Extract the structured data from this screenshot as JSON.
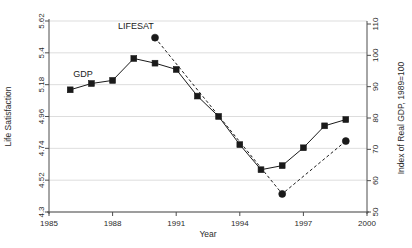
{
  "chart_data": {
    "type": "line",
    "title": "",
    "xlabel": "Year",
    "ylabel_left": "Life Satisfaction",
    "ylabel_right": "Index of Real GDP, 1989=100",
    "xlim": [
      1985,
      2000
    ],
    "ylim_left": [
      4.3,
      5.62
    ],
    "ylim_right": [
      50,
      110
    ],
    "xticks": [
      1985,
      1988,
      1991,
      1994,
      1997,
      2000
    ],
    "xtick_labels": [
      "1985",
      "1988",
      "1991",
      "1994",
      "1997",
      "2000"
    ],
    "yticks_left": [
      4.3,
      4.52,
      4.74,
      4.96,
      5.18,
      5.4,
      5.62
    ],
    "ytick_labels_left": [
      "4.3",
      "4.52",
      "4.74",
      "4.96",
      "5.18",
      "5.4",
      "5.62"
    ],
    "yticks_right": [
      50,
      60,
      70,
      80,
      90,
      100,
      110
    ],
    "ytick_labels_right": [
      "50",
      "60",
      "70",
      "80",
      "90",
      "100",
      "110"
    ],
    "grid": true,
    "grid_axis": "y",
    "legend": "inline-annotations",
    "series": [
      {
        "name": "GDP",
        "axis": "right",
        "marker": "square",
        "linestyle": "solid",
        "color": "#1a1a1a",
        "label_x": 1986.6,
        "label_y": 92.5,
        "x": [
          1986,
          1987,
          1988,
          1989,
          1990,
          1991,
          1992,
          1993,
          1994,
          1995,
          1996,
          1997,
          1998,
          1999
        ],
        "values": [
          89.0,
          91.0,
          92.0,
          99.0,
          97.5,
          95.5,
          87.0,
          80.5,
          71.5,
          63.5,
          64.8,
          70.5,
          77.5,
          79.5
        ]
      },
      {
        "name": "LIFESAT",
        "axis": "left",
        "marker": "circle",
        "linestyle": "dashed",
        "color": "#1a1a1a",
        "label_x": 1989.1,
        "label_y": 5.565,
        "x": [
          1990,
          1996,
          1999
        ],
        "values": [
          5.505,
          4.425,
          4.79
        ]
      }
    ],
    "annotations": [
      {
        "text": "LIFESAT",
        "x": 1989.1,
        "y": 5.565
      },
      {
        "text": "GDP",
        "x": 1986.6,
        "y": 5.235
      }
    ]
  }
}
